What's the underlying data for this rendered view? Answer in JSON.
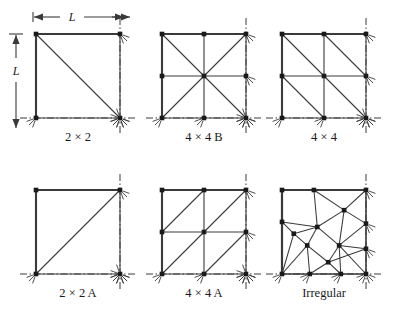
{
  "figure": {
    "type": "finite-element-mesh-diagram",
    "background": "#ffffff",
    "line_color": "#3a3a3a",
    "node_color": "#1a1a1a",
    "dimension_labels": {
      "horizontal": "L",
      "vertical": "L"
    },
    "panels": [
      {
        "id": "mesh-2x2",
        "caption": "2 × 2",
        "caption_plain": "2 x 2",
        "grid": 1,
        "diagonal": "top-left-to-bottom-right",
        "nodes": 4,
        "elements": 2
      },
      {
        "id": "mesh-4x4-b",
        "caption": "4 × 4 B",
        "caption_plain": "4 x 4 B",
        "grid": 2,
        "diagonal": "both-crossing-center",
        "nodes": 9,
        "elements": 8
      },
      {
        "id": "mesh-4x4",
        "caption": "4 × 4",
        "caption_plain": "4 x 4",
        "grid": 2,
        "diagonal": "top-left-to-bottom-right",
        "nodes": 9,
        "elements": 8
      },
      {
        "id": "mesh-2x2-a",
        "caption": "2 × 2 A",
        "caption_plain": "2 x 2 A",
        "grid": 1,
        "diagonal": "bottom-left-to-top-right",
        "nodes": 4,
        "elements": 2
      },
      {
        "id": "mesh-4x4-a",
        "caption": "4 × 4 A",
        "caption_plain": "4 x 4 A",
        "grid": 2,
        "diagonal": "bottom-left-to-top-right",
        "nodes": 9,
        "elements": 8
      },
      {
        "id": "mesh-irregular",
        "caption": "Irregular",
        "caption_plain": "Irregular",
        "grid": 0,
        "diagonal": "irregular-triangulation",
        "nodes": 16,
        "elements": 18
      }
    ],
    "boundary_notation": {
      "solid_edges": "top-and-left",
      "symmetry_lines": "bottom-and-right",
      "symmetry_line_style": "dash-dot",
      "support_marks": "hatch-starburst"
    }
  }
}
